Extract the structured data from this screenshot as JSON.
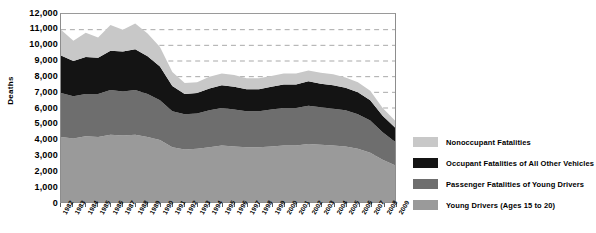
{
  "chart_data": {
    "type": "area",
    "stacked": true,
    "title": "",
    "xlabel": "",
    "ylabel": "Deaths",
    "ylim": [
      0,
      12000
    ],
    "ytick_step": 1000,
    "yticks": [
      "0",
      "1,000",
      "2,000",
      "3,000",
      "4,000",
      "5,000",
      "6,000",
      "7,000",
      "8,000",
      "9,000",
      "10,000",
      "11,000",
      "12,000"
    ],
    "grid": "horizontal-dashed",
    "legend_position": "right",
    "categories": [
      "1982",
      "1983",
      "1984",
      "1985",
      "1986",
      "1987",
      "1988",
      "1989",
      "1990",
      "1991",
      "1992",
      "1993",
      "1994",
      "1995",
      "1996",
      "1997",
      "1998",
      "1999",
      "2000",
      "2001",
      "2002",
      "2003",
      "2004",
      "2005",
      "2006",
      "2007",
      "2008",
      "2009"
    ],
    "series": [
      {
        "name": "Young Drivers (Ages 15 to 20)",
        "color": "#9a9a9a",
        "values": [
          4150,
          4050,
          4200,
          4150,
          4300,
          4250,
          4300,
          4150,
          3950,
          3500,
          3350,
          3400,
          3500,
          3600,
          3550,
          3500,
          3500,
          3550,
          3600,
          3600,
          3700,
          3650,
          3600,
          3550,
          3400,
          3150,
          2700,
          2350
        ]
      },
      {
        "name": "Passenger Fatalities of Young Drivers",
        "color": "#6e6e6e",
        "values": [
          2800,
          2700,
          2700,
          2750,
          2850,
          2800,
          2850,
          2750,
          2550,
          2300,
          2250,
          2250,
          2350,
          2400,
          2350,
          2300,
          2300,
          2350,
          2400,
          2400,
          2450,
          2400,
          2350,
          2300,
          2200,
          2050,
          1750,
          1500
        ]
      },
      {
        "name": "Occupant Fatalities of All Other Vehicles",
        "color": "#141414",
        "values": [
          2400,
          2250,
          2350,
          2300,
          2500,
          2550,
          2600,
          2400,
          2150,
          1600,
          1300,
          1300,
          1400,
          1450,
          1450,
          1400,
          1400,
          1450,
          1500,
          1500,
          1550,
          1500,
          1500,
          1450,
          1400,
          1300,
          1050,
          900
        ]
      },
      {
        "name": "Nonoccupant Fatalities",
        "color": "#c8c8c8",
        "values": [
          1650,
          1300,
          1550,
          1300,
          1650,
          1400,
          1650,
          1450,
          1250,
          900,
          700,
          700,
          750,
          750,
          750,
          700,
          700,
          700,
          700,
          700,
          700,
          700,
          700,
          650,
          650,
          600,
          500,
          450
        ]
      }
    ],
    "totals": [
      11000,
      10300,
      10800,
      10500,
      11300,
      11000,
      11400,
      10750,
      9900,
      8300,
      7600,
      7650,
      8000,
      8200,
      8100,
      7900,
      7900,
      8050,
      8200,
      8200,
      8400,
      8250,
      8150,
      7950,
      7650,
      7100,
      6000,
      5200
    ]
  },
  "legend": {
    "items": [
      {
        "label": "Nonoccupant Fatalities",
        "color": "#c8c8c8"
      },
      {
        "label": "Occupant Fatalities of All Other Vehicles",
        "color": "#141414"
      },
      {
        "label": "Passenger Fatalities of Young Drivers",
        "color": "#6e6e6e"
      },
      {
        "label": "Young Drivers (Ages 15 to 20)",
        "color": "#9a9a9a"
      }
    ]
  }
}
